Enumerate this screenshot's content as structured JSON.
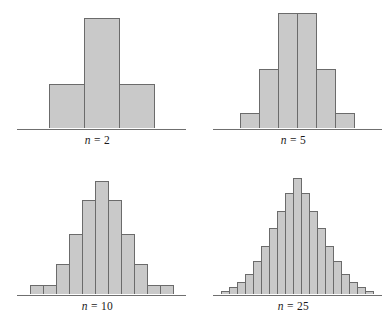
{
  "figure": {
    "title": "",
    "bar_fill_color": "#c9c9c9",
    "bar_border_color": "#6b6b6b",
    "axis_color": "#6f6f6f",
    "background_color": "#ffffff"
  },
  "panels": [
    {
      "id": "n2",
      "caption_symbol": "n",
      "caption_equals": "=",
      "caption_value": "2",
      "caption": "n = 2"
    },
    {
      "id": "n5",
      "caption_symbol": "n",
      "caption_equals": "=",
      "caption_value": "5",
      "caption": "n = 5"
    },
    {
      "id": "n10",
      "caption_symbol": "n",
      "caption_equals": "=",
      "caption_value": "10",
      "caption": "n = 10"
    },
    {
      "id": "n25",
      "caption_symbol": "n",
      "caption_equals": "=",
      "caption_value": "25",
      "caption": "n = 25"
    }
  ],
  "chart_data": [
    {
      "type": "bar",
      "title": "n = 2",
      "xlabel": "",
      "ylabel": "",
      "grid": false,
      "legend": null,
      "axis": "horizontal baseline only, no tick labels",
      "categories": [
        "1",
        "2",
        "3"
      ],
      "values": [
        40,
        100,
        40
      ],
      "ylim": [
        0,
        115
      ],
      "bar_width_px": 36,
      "n": 2
    },
    {
      "type": "bar",
      "title": "n = 5",
      "xlabel": "",
      "ylabel": "",
      "grid": false,
      "legend": null,
      "axis": "horizontal baseline only, no tick labels",
      "categories": [
        "1",
        "2",
        "3",
        "4",
        "5",
        "6"
      ],
      "values": [
        14,
        55,
        108,
        108,
        55,
        14
      ],
      "ylim": [
        0,
        118
      ],
      "bar_width_px": 20,
      "n": 5
    },
    {
      "type": "bar",
      "title": "n = 10",
      "xlabel": "",
      "ylabel": "",
      "grid": false,
      "legend": null,
      "axis": "horizontal baseline only, no tick labels",
      "categories": [
        "1",
        "2",
        "3",
        "4",
        "5",
        "6",
        "7",
        "8",
        "9",
        "10",
        "11"
      ],
      "values": [
        7,
        7,
        24,
        48,
        75,
        90,
        75,
        48,
        24,
        7,
        7
      ],
      "ylim": [
        0,
        100
      ],
      "bar_width_px": 14,
      "n": 10
    },
    {
      "type": "bar",
      "title": "n = 25",
      "xlabel": "",
      "ylabel": "",
      "grid": false,
      "legend": null,
      "axis": "horizontal baseline only, no tick labels",
      "categories": [
        "1",
        "2",
        "3",
        "4",
        "5",
        "6",
        "7",
        "8",
        "9",
        "10",
        "11",
        "12",
        "13",
        "14",
        "15",
        "16",
        "17",
        "18",
        "19"
      ],
      "values": [
        3,
        6,
        11,
        18,
        30,
        44,
        60,
        76,
        92,
        106,
        92,
        76,
        60,
        44,
        30,
        18,
        11,
        6,
        3
      ],
      "ylim": [
        0,
        115
      ],
      "bar_width_px": 9,
      "n": 25
    }
  ]
}
